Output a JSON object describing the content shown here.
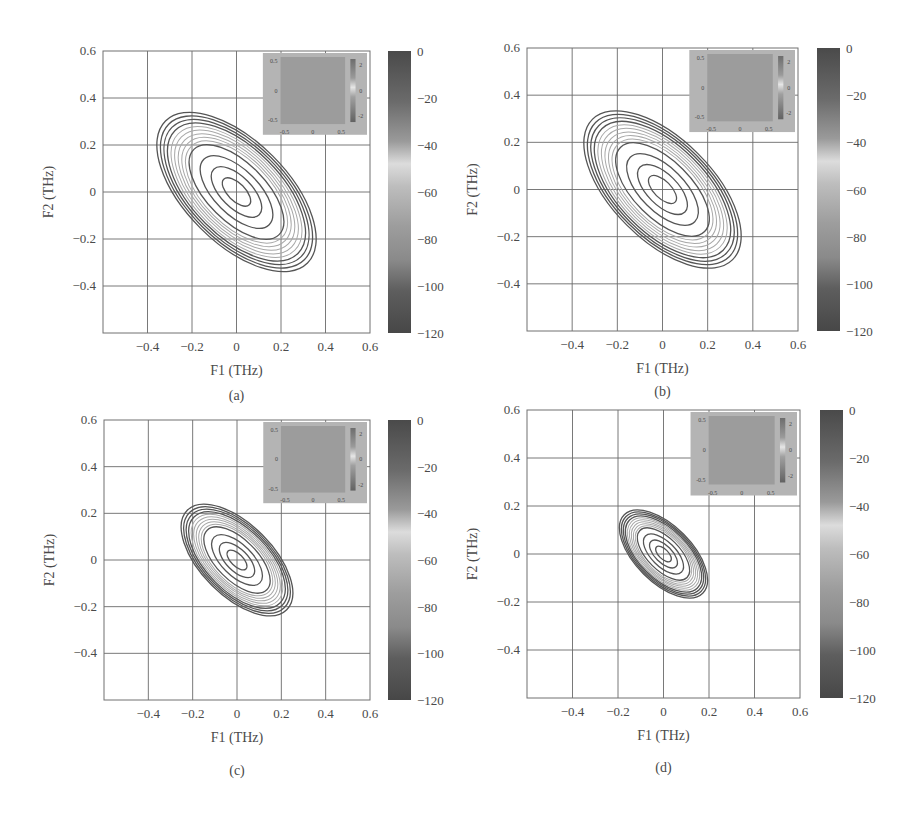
{
  "figure": {
    "panels": [
      "a",
      "b",
      "c",
      "d"
    ]
  },
  "colors": {
    "grid": "#6a6a6a",
    "axes": "#707070",
    "contour_dark": "#555555",
    "contour_light": "#a8a8a8",
    "inset_bg": "#b4b4b4",
    "inset_plot": "#9c9c9c",
    "text": "#4a4a4a"
  },
  "chart_data": [
    {
      "type": "contour",
      "panel_label": "(a)",
      "xlabel": "F1 (THz)",
      "ylabel": "F2 (THz)",
      "xlim": [
        -0.6,
        0.6
      ],
      "ylim": [
        -0.6,
        0.6
      ],
      "xticks": [
        "-0.4",
        "-0.2",
        "0",
        "0.2",
        "0.4",
        "0.6"
      ],
      "yticks": [
        "0.6",
        "0.4",
        "0.2",
        "0",
        "-0.2",
        "-0.4"
      ],
      "grid": true,
      "colorbar": {
        "ticks": [
          "0",
          "-20",
          "-40",
          "-60",
          "-80",
          "-100",
          "-120"
        ],
        "range": [
          -120,
          0
        ]
      },
      "ellipse": {
        "center": [
          0.0,
          0.0
        ],
        "outer_extent_x": [
          -0.37,
          0.37
        ],
        "outer_extent_y": [
          -0.36,
          0.36
        ],
        "tilt_deg": -45,
        "levels": 13
      },
      "inset": {
        "xticks": [
          "-0.5",
          "0",
          "0.5"
        ],
        "yticks": [
          "0.5",
          "0",
          "-0.5"
        ],
        "cbar_ticks": [
          "2",
          "0",
          "-2"
        ]
      }
    },
    {
      "type": "contour",
      "panel_label": "(b)",
      "xlabel": "F1 (THz)",
      "ylabel": "F2 (THz)",
      "xlim": [
        -0.6,
        0.6
      ],
      "ylim": [
        -0.6,
        0.6
      ],
      "xticks": [
        "-0.4",
        "-0.2",
        "0",
        "0.2",
        "0.4",
        "0.6"
      ],
      "yticks": [
        "0.6",
        "0.4",
        "0.2",
        "0",
        "-0.2",
        "-0.4"
      ],
      "grid": true,
      "colorbar": {
        "ticks": [
          "0",
          "-20",
          "-40",
          "-60",
          "-80",
          "-100",
          "-120"
        ],
        "range": [
          -120,
          0
        ]
      },
      "ellipse": {
        "center": [
          0.0,
          0.0
        ],
        "outer_extent_x": [
          -0.36,
          0.36
        ],
        "outer_extent_y": [
          -0.36,
          0.36
        ],
        "tilt_deg": -45,
        "levels": 13
      },
      "inset": {
        "xticks": [
          "-0.5",
          "0",
          "0.5"
        ],
        "yticks": [
          "0.5",
          "0",
          "-0.5"
        ],
        "cbar_ticks": [
          "2",
          "0",
          "-2"
        ]
      }
    },
    {
      "type": "contour",
      "panel_label": "(c)",
      "xlabel": "F1 (THz)",
      "ylabel": "F2 (THz)",
      "xlim": [
        -0.6,
        0.6
      ],
      "ylim": [
        -0.6,
        0.6
      ],
      "xticks": [
        "-0.4",
        "-0.2",
        "0",
        "0.2",
        "0.4",
        "0.6"
      ],
      "yticks": [
        "0.6",
        "0.4",
        "0.2",
        "0",
        "-0.2",
        "-0.4"
      ],
      "grid": true,
      "colorbar": {
        "ticks": [
          "0",
          "-20",
          "-40",
          "-60",
          "-80",
          "-100",
          "-120"
        ],
        "range": [
          -120,
          0
        ]
      },
      "ellipse": {
        "center": [
          0.0,
          0.0
        ],
        "outer_extent_x": [
          -0.26,
          0.26
        ],
        "outer_extent_y": [
          -0.25,
          0.25
        ],
        "tilt_deg": -45,
        "levels": 13
      },
      "inset": {
        "xticks": [
          "-0.5",
          "0",
          "0.5"
        ],
        "yticks": [
          "0.5",
          "0",
          "-0.5"
        ],
        "cbar_ticks": [
          "2",
          "0",
          "-2"
        ]
      }
    },
    {
      "type": "contour",
      "panel_label": "(d)",
      "xlabel": "F1 (THz)",
      "ylabel": "F2 (THz)",
      "xlim": [
        -0.6,
        0.6
      ],
      "ylim": [
        -0.6,
        0.6
      ],
      "xticks": [
        "-0.4",
        "-0.2",
        "0",
        "0.2",
        "0.4",
        "0.6"
      ],
      "yticks": [
        "0.6",
        "0.4",
        "0.2",
        "0",
        "-0.2",
        "-0.4"
      ],
      "grid": true,
      "colorbar": {
        "ticks": [
          "0",
          "-20",
          "-40",
          "-60",
          "-80",
          "-100",
          "-120"
        ],
        "range": [
          -120,
          0
        ]
      },
      "ellipse": {
        "center": [
          0.0,
          0.0
        ],
        "outer_extent_x": [
          -0.2,
          0.2
        ],
        "outer_extent_y": [
          -0.2,
          0.2
        ],
        "tilt_deg": -45,
        "levels": 13
      },
      "inset": {
        "xticks": [
          "-0.5",
          "0",
          "0.5"
        ],
        "yticks": [
          "0.5",
          "0",
          "-0.5"
        ],
        "cbar_ticks": [
          "2",
          "0",
          "-2"
        ]
      }
    }
  ]
}
